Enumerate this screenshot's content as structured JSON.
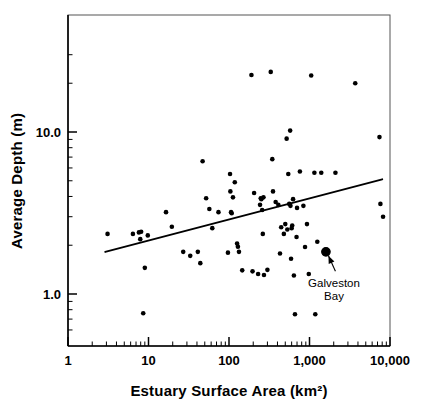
{
  "figure": {
    "name": "estuary-surface-area-vs-average-depth-scatter",
    "background": "#ffffff",
    "foreground": "#000000"
  },
  "chart_data": {
    "type": "scatter",
    "title": "",
    "xlabel": "Estuary Surface Area (km²)",
    "ylabel": "Average Depth (m)",
    "xscale": "log",
    "yscale": "log",
    "xlim": [
      1,
      10000
    ],
    "ylim": [
      0.55,
      38
    ],
    "grid": false,
    "legend": null,
    "xticks": [
      1,
      10,
      100,
      1000,
      10000
    ],
    "xtick_labels": [
      "1",
      "10",
      "100",
      "1,000",
      "10,000"
    ],
    "yticks": [
      1.0,
      10.0
    ],
    "ytick_labels": [
      "1.0",
      "10.0"
    ],
    "series": [
      {
        "name": "estuaries",
        "marker": "filled-circle",
        "color": "#000000",
        "size": 4.6,
        "points": [
          [
            3.1,
            2.35
          ],
          [
            6.4,
            2.35
          ],
          [
            7.6,
            2.4
          ],
          [
            8.1,
            2.42
          ],
          [
            7.9,
            2.18
          ],
          [
            9.8,
            2.3
          ],
          [
            9.0,
            1.45
          ],
          [
            8.6,
            0.76
          ],
          [
            16.5,
            3.2
          ],
          [
            19.5,
            2.6
          ],
          [
            27.0,
            1.82
          ],
          [
            33.0,
            1.72
          ],
          [
            41.0,
            1.82
          ],
          [
            44.0,
            1.55
          ],
          [
            47.0,
            6.6
          ],
          [
            52.0,
            3.9
          ],
          [
            57.0,
            3.35
          ],
          [
            62.0,
            2.55
          ],
          [
            74.0,
            3.2
          ],
          [
            97.0,
            1.8
          ],
          [
            103.0,
            5.5
          ],
          [
            104.0,
            4.3
          ],
          [
            106.0,
            3.2
          ],
          [
            108.0,
            3.15
          ],
          [
            112.0,
            3.95
          ],
          [
            118.0,
            4.9
          ],
          [
            126.0,
            2.05
          ],
          [
            129.0,
            1.96
          ],
          [
            133.0,
            1.82
          ],
          [
            146.0,
            1.4
          ],
          [
            190.0,
            22.5
          ],
          [
            196.0,
            1.38
          ],
          [
            205.0,
            4.2
          ],
          [
            230.0,
            1.33
          ],
          [
            243.0,
            3.55
          ],
          [
            248.0,
            3.9
          ],
          [
            252.0,
            3.85
          ],
          [
            258.0,
            3.3
          ],
          [
            263.0,
            2.35
          ],
          [
            268.0,
            3.95
          ],
          [
            272.0,
            1.31
          ],
          [
            300.0,
            1.41
          ],
          [
            330.0,
            23.5
          ],
          [
            345.0,
            6.8
          ],
          [
            352.0,
            4.3
          ],
          [
            380.0,
            3.7
          ],
          [
            410.0,
            3.55
          ],
          [
            430.0,
            1.78
          ],
          [
            445.0,
            2.58
          ],
          [
            480.0,
            2.35
          ],
          [
            500.0,
            2.7
          ],
          [
            520.0,
            9.1
          ],
          [
            530.0,
            2.5
          ],
          [
            545.0,
            5.5
          ],
          [
            560.0,
            3.6
          ],
          [
            575.0,
            10.2
          ],
          [
            580.0,
            3.5
          ],
          [
            590.0,
            1.65
          ],
          [
            600.0,
            2.55
          ],
          [
            610.0,
            2.65
          ],
          [
            625.0,
            3.85
          ],
          [
            640.0,
            1.3
          ],
          [
            660.0,
            0.75
          ],
          [
            690.0,
            2.25
          ],
          [
            700.0,
            3.4
          ],
          [
            760.0,
            5.7
          ],
          [
            840.0,
            3.5
          ],
          [
            880.0,
            1.95
          ],
          [
            930.0,
            2.7
          ],
          [
            980.0,
            1.33
          ],
          [
            1050.0,
            22.3
          ],
          [
            1150.0,
            5.6
          ],
          [
            1180.0,
            0.75
          ],
          [
            1250.0,
            2.1
          ],
          [
            1400.0,
            5.6
          ],
          [
            2100.0,
            5.6
          ],
          [
            3700.0,
            20.0
          ],
          [
            7400.0,
            9.3
          ],
          [
            7600.0,
            3.6
          ],
          [
            8200.0,
            3.0
          ]
        ]
      },
      {
        "name": "galveston-bay",
        "marker": "large-filled-circle",
        "color": "#000000",
        "size": 8.5,
        "points": [
          [
            1600.0,
            1.82
          ]
        ]
      }
    ],
    "trend_line": {
      "name": "regression-line",
      "color": "#000000",
      "width": 2.0,
      "x_start": 2.9,
      "y_start": 1.82,
      "x_end": 8000.0,
      "y_end": 5.1
    },
    "annotations": [
      {
        "name": "galveston-bay-annotation",
        "text_line1": "Galveston",
        "text_line2": "Bay",
        "text_x": 2250.0,
        "text_y": 1.22,
        "arrow_from": [
          2100.0,
          1.38
        ],
        "arrow_to": [
          1720.0,
          1.72
        ]
      }
    ]
  }
}
